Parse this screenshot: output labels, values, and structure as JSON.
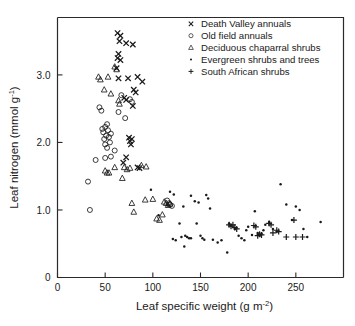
{
  "chart_data": {
    "type": "scatter",
    "title": "",
    "xlabel": "Leaf specific weight  (g m-2)",
    "xlabel_main": "Leaf specific weight",
    "xlabel_unit_pre": "(g m",
    "xlabel_unit_sup": "-2",
    "xlabel_unit_post": ")",
    "ylabel_main": "Leaf nitrogen",
    "ylabel_unit_pre": "(mmol g",
    "ylabel_unit_sup": "-1",
    "ylabel_unit_post": ")",
    "xlim": [
      0,
      300
    ],
    "ylim": [
      0,
      3.85
    ],
    "xticks": [
      0,
      50,
      100,
      150,
      200,
      250
    ],
    "xticklabels": [
      "0",
      "50",
      "100",
      "150",
      "200",
      "250"
    ],
    "yticks": [
      0,
      1.0,
      2.0,
      3.0
    ],
    "yticklabels": [
      "0",
      "1.0",
      "2.0",
      "3.0"
    ],
    "grid": false,
    "legend_position": "top-right",
    "legend": [
      {
        "label": "Death Valley annuals",
        "marker": "x-marker"
      },
      {
        "label": "Old field annuals",
        "marker": "circle-marker"
      },
      {
        "label": "Deciduous chaparral shrubs",
        "marker": "triangle-marker"
      },
      {
        "label": "Evergreen shrubs and trees",
        "marker": "dot-marker"
      },
      {
        "label": "South African shrubs",
        "marker": "plus-marker"
      }
    ],
    "series": [
      {
        "name": "Death Valley annuals",
        "marker": "x-marker",
        "points": [
          [
            63,
            3.62
          ],
          [
            66,
            3.58
          ],
          [
            65,
            3.5
          ],
          [
            72,
            3.47
          ],
          [
            79,
            3.45
          ],
          [
            64,
            3.31
          ],
          [
            63,
            3.25
          ],
          [
            66,
            3.22
          ],
          [
            62,
            3.1
          ],
          [
            64,
            2.95
          ],
          [
            74,
            2.95
          ],
          [
            84,
            2.97
          ],
          [
            89,
            2.9
          ],
          [
            80,
            2.78
          ],
          [
            82,
            2.74
          ],
          [
            70,
            2.66
          ],
          [
            72,
            2.63
          ],
          [
            79,
            2.54
          ],
          [
            75,
            2.07
          ],
          [
            76,
            2.02
          ],
          [
            77,
            1.97
          ],
          [
            78,
            2.05
          ],
          [
            72,
            1.78
          ],
          [
            69,
            1.7
          ],
          [
            84,
            1.63
          ],
          [
            86,
            1.62
          ]
        ]
      },
      {
        "name": "Old field annuals",
        "marker": "circle-marker",
        "points": [
          [
            32,
            1.42
          ],
          [
            34,
            1.0
          ],
          [
            40,
            1.74
          ],
          [
            44,
            2.52
          ],
          [
            46,
            2.47
          ],
          [
            47,
            2.2
          ],
          [
            48,
            2.15
          ],
          [
            49,
            2.05
          ],
          [
            50,
            1.97
          ],
          [
            50,
            2.23
          ],
          [
            51,
            2.1
          ],
          [
            52,
            2.27
          ],
          [
            53,
            2.18
          ],
          [
            52,
            1.92
          ],
          [
            54,
            2.08
          ],
          [
            55,
            2.0
          ],
          [
            56,
            2.13
          ],
          [
            50,
            1.77
          ],
          [
            56,
            1.79
          ],
          [
            60,
            1.88
          ],
          [
            64,
            2.45
          ],
          [
            67,
            2.7
          ],
          [
            71,
            2.36
          ],
          [
            76,
            2.64
          ],
          [
            78,
            2.6
          ],
          [
            115,
            1.14
          ],
          [
            117,
            1.1
          ],
          [
            118,
            1.08
          ],
          [
            120,
            1.06
          ]
        ]
      },
      {
        "name": "Deciduous chaparral shrubs",
        "marker": "triangle-marker",
        "points": [
          [
            43,
            2.97
          ],
          [
            45,
            2.93
          ],
          [
            53,
            2.97
          ],
          [
            49,
            2.78
          ],
          [
            56,
            2.72
          ],
          [
            60,
            3.12
          ],
          [
            62,
            3.08
          ],
          [
            64,
            2.62
          ],
          [
            65,
            2.57
          ],
          [
            50,
            1.58
          ],
          [
            52,
            1.55
          ],
          [
            54,
            1.55
          ],
          [
            60,
            1.63
          ],
          [
            68,
            1.47
          ],
          [
            70,
            1.63
          ],
          [
            73,
            1.6
          ],
          [
            76,
            1.62
          ],
          [
            88,
            1.66
          ],
          [
            93,
            1.64
          ],
          [
            78,
            1.1
          ],
          [
            80,
            0.97
          ],
          [
            92,
            1.15
          ],
          [
            100,
            1.16
          ],
          [
            104,
            0.87
          ],
          [
            107,
            0.85
          ],
          [
            110,
            0.93
          ],
          [
            112,
            1.12
          ],
          [
            114,
            1.1
          ],
          [
            116,
            1.07
          ],
          [
            118,
            1.09
          ]
        ]
      },
      {
        "name": "Evergreen shrubs and trees",
        "marker": "dot-marker",
        "points": [
          [
            98,
            1.3
          ],
          [
            106,
            0.92
          ],
          [
            118,
            1.27
          ],
          [
            122,
            1.23
          ],
          [
            121,
            0.57
          ],
          [
            124,
            0.55
          ],
          [
            128,
            0.8
          ],
          [
            130,
            0.6
          ],
          [
            132,
            1.05
          ],
          [
            134,
            0.62
          ],
          [
            136,
            0.6
          ],
          [
            133,
            0.46
          ],
          [
            138,
            0.58
          ],
          [
            140,
            1.21
          ],
          [
            144,
            1.13
          ],
          [
            146,
            0.8
          ],
          [
            148,
            1.11
          ],
          [
            150,
            0.62
          ],
          [
            152,
            0.58
          ],
          [
            154,
            0.56
          ],
          [
            156,
            1.22
          ],
          [
            158,
            1.17
          ],
          [
            160,
            1.02
          ],
          [
            163,
            0.56
          ],
          [
            168,
            0.52
          ],
          [
            178,
            0.37
          ],
          [
            180,
            0.8
          ],
          [
            182,
            0.77
          ],
          [
            186,
            0.72
          ],
          [
            190,
            0.62
          ],
          [
            193,
            0.58
          ],
          [
            196,
            0.55
          ],
          [
            198,
            0.7
          ],
          [
            200,
            0.75
          ],
          [
            204,
            0.63
          ],
          [
            207,
            0.98
          ],
          [
            210,
            0.66
          ],
          [
            212,
            0.62
          ],
          [
            214,
            0.65
          ],
          [
            216,
            0.7
          ],
          [
            218,
            0.78
          ],
          [
            222,
            0.82
          ],
          [
            226,
            0.72
          ],
          [
            230,
            0.68
          ],
          [
            234,
            1.38
          ],
          [
            240,
            1.08
          ],
          [
            246,
            0.85
          ],
          [
            250,
            1.05
          ],
          [
            254,
            1.0
          ],
          [
            258,
            0.72
          ],
          [
            262,
            0.6
          ],
          [
            276,
            0.82
          ],
          [
            115,
            1.07
          ],
          [
            140,
            0.58
          ],
          [
            172,
            0.55
          ]
        ]
      },
      {
        "name": "South African shrubs",
        "marker": "plus-marker",
        "points": [
          [
            180,
            0.78
          ],
          [
            182,
            0.76
          ],
          [
            184,
            0.78
          ],
          [
            186,
            0.74
          ],
          [
            188,
            0.72
          ],
          [
            206,
            0.77
          ],
          [
            208,
            0.75
          ],
          [
            210,
            0.62
          ],
          [
            212,
            0.64
          ],
          [
            214,
            0.63
          ],
          [
            222,
            0.8
          ],
          [
            224,
            0.78
          ],
          [
            226,
            0.66
          ],
          [
            230,
            0.7
          ],
          [
            232,
            0.68
          ],
          [
            240,
            0.6
          ],
          [
            248,
            0.85
          ],
          [
            250,
            0.6
          ],
          [
            257,
            0.6
          ]
        ]
      }
    ]
  }
}
